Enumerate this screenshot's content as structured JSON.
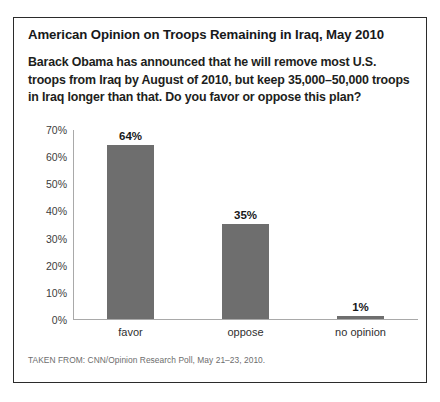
{
  "figure": {
    "title": "American Opinion on Troops Remaining in Iraq, May 2010",
    "question": "Barack Obama has announced that he will remove most U.S. troops from Iraq by August of 2010, but keep 35,000–50,000 troops in Iraq longer than that. Do you favor or oppose this plan?",
    "source_note": "TAKEN FROM: CNN/Opinion Research Poll, May 21–23, 2010."
  },
  "colors": {
    "bar": "#6e6e6e",
    "axis": "#a9a9a9",
    "frame": "#2b2b2b",
    "title_text": "#17181a",
    "source_text": "#6d6d6d"
  },
  "chart_data": {
    "type": "bar",
    "title": "American Opinion on Troops Remaining in Iraq, May 2010",
    "subtitle": "Barack Obama has announced that he will remove most U.S. troops from Iraq by August of 2010, but keep 35,000–50,000 troops in Iraq longer than that. Do you favor or oppose this plan?",
    "xlabel": "",
    "ylabel": "",
    "categories": [
      "favor",
      "oppose",
      "no opinion"
    ],
    "values": [
      64,
      35,
      1
    ],
    "value_labels": [
      "64%",
      "35%",
      "1%"
    ],
    "ylim": [
      0,
      70
    ],
    "yticks": [
      0,
      10,
      20,
      30,
      40,
      50,
      60,
      70
    ],
    "ytick_labels": [
      "0%",
      "10%",
      "20%",
      "30%",
      "40%",
      "50%",
      "60%",
      "70%"
    ],
    "grid": false,
    "legend": null,
    "units": "percent"
  }
}
